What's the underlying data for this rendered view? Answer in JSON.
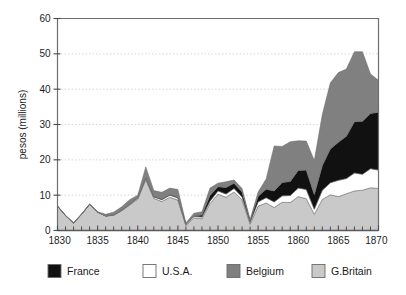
{
  "chart_data": {
    "type": "area",
    "stacked": true,
    "title": "",
    "xlabel": "",
    "ylabel": "pesos (millions)",
    "xlim": [
      1830,
      1870
    ],
    "ylim": [
      0,
      60
    ],
    "y_ticks": [
      0,
      10,
      20,
      30,
      40,
      50,
      60
    ],
    "y_ticklabels": [
      "0",
      "10",
      "20",
      "30",
      "40",
      "50",
      "60"
    ],
    "x_ticks": [
      1830,
      1835,
      1840,
      1845,
      1850,
      1855,
      1860,
      1865,
      1870
    ],
    "x_ticklabels": [
      "1830",
      "1835",
      "1840",
      "1845",
      "1850",
      "1855",
      "1860",
      "1865",
      "1870"
    ],
    "x_minor_tick_step": 1,
    "grid": "horizontal-dotted",
    "legend_position": "bottom",
    "x": [
      1830,
      1831,
      1832,
      1833,
      1834,
      1835,
      1836,
      1837,
      1838,
      1839,
      1840,
      1841,
      1842,
      1843,
      1844,
      1845,
      1846,
      1847,
      1848,
      1849,
      1850,
      1851,
      1852,
      1853,
      1854,
      1855,
      1856,
      1857,
      1858,
      1859,
      1860,
      1861,
      1862,
      1863,
      1864,
      1865,
      1866,
      1867,
      1868,
      1869,
      1870
    ],
    "stack_order_bottom_to_top": [
      "G.Britain",
      "U.S.A.",
      "France",
      "Belgium"
    ],
    "series": [
      {
        "name": "G.Britain",
        "color": "#c9c9c9",
        "values": [
          6.9,
          4.2,
          2.1,
          4.6,
          7.4,
          5.2,
          4.1,
          4.3,
          5.6,
          7.2,
          8.9,
          14.4,
          9.1,
          8.2,
          9.4,
          8.6,
          1.4,
          3.6,
          3.3,
          7.6,
          10.3,
          9.4,
          10.9,
          8.7,
          1.8,
          6.9,
          7.8,
          6.5,
          8.0,
          7.9,
          9.6,
          9.0,
          4.6,
          8.8,
          10.1,
          9.6,
          10.4,
          11.2,
          11.4,
          12.1,
          11.9
        ]
      },
      {
        "name": "U.S.A.",
        "color": "#ffffff",
        "values": [
          0.0,
          0.0,
          0.0,
          0.0,
          0.0,
          0.0,
          0.0,
          0.1,
          0.1,
          0.2,
          0.3,
          0.4,
          0.4,
          0.5,
          0.6,
          0.6,
          0.3,
          0.4,
          0.5,
          0.7,
          0.9,
          0.9,
          1.0,
          0.8,
          0.5,
          1.2,
          1.5,
          1.6,
          1.8,
          2.0,
          2.4,
          2.6,
          1.4,
          2.6,
          3.4,
          4.6,
          4.3,
          5.1,
          4.5,
          5.4,
          5.2
        ]
      },
      {
        "name": "France",
        "color": "#111111",
        "values": [
          0.0,
          0.0,
          0.0,
          0.0,
          0.0,
          0.0,
          0.0,
          0.0,
          0.0,
          0.0,
          0.1,
          0.2,
          0.2,
          0.2,
          0.2,
          0.2,
          0.1,
          0.2,
          0.6,
          1.6,
          1.2,
          1.9,
          1.5,
          1.4,
          0.4,
          1.6,
          2.4,
          3.1,
          3.8,
          4.0,
          5.0,
          5.5,
          4.2,
          7.0,
          9.6,
          10.8,
          12.0,
          14.5,
          15.0,
          15.6,
          16.4
        ]
      },
      {
        "name": "Belgium",
        "color": "#808080",
        "values": [
          0.1,
          0.1,
          0.1,
          0.1,
          0.1,
          0.1,
          0.5,
          0.8,
          1.0,
          1.3,
          0.7,
          3.0,
          1.6,
          1.9,
          1.8,
          2.2,
          0.3,
          0.7,
          0.9,
          2.1,
          1.0,
          1.6,
          0.9,
          1.0,
          0.4,
          1.2,
          2.9,
          12.7,
          10.2,
          11.2,
          8.4,
          8.2,
          9.6,
          14.4,
          18.7,
          19.7,
          19.0,
          19.8,
          19.7,
          11.2,
          9.0
        ]
      }
    ]
  },
  "legend": {
    "items": [
      {
        "label": "France",
        "color": "#111111"
      },
      {
        "label": "U.S.A.",
        "color": "#ffffff"
      },
      {
        "label": "Belgium",
        "color": "#808080"
      },
      {
        "label": "G.Britain",
        "color": "#c9c9c9"
      }
    ]
  }
}
